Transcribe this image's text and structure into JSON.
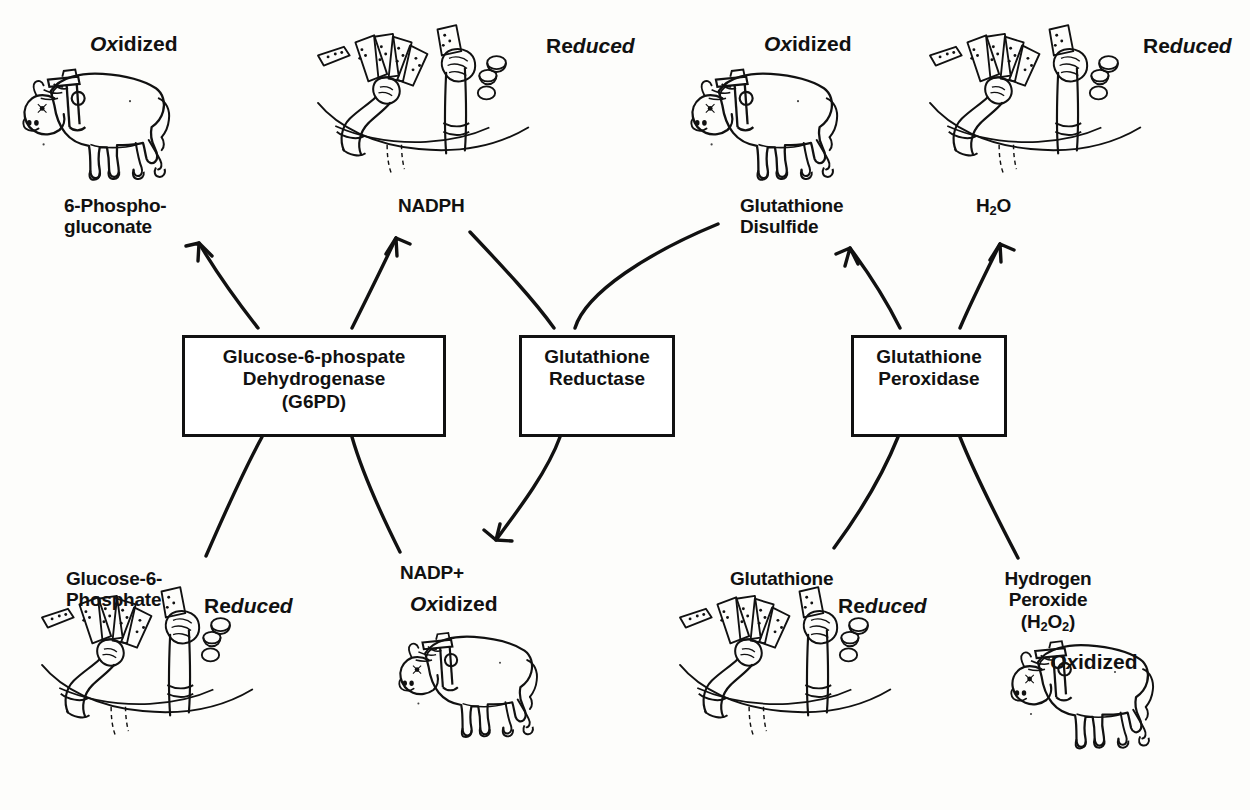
{
  "diagram": {
    "type": "biochemical-pathway-mnemonic",
    "background_color": "#fdfdfb",
    "ink_color": "#111111"
  },
  "enzymes": [
    {
      "id": "g6pd",
      "label": "Glucose-6-phospate\nDehydrogenase\n(G6PD)"
    },
    {
      "id": "glutathione-reductase",
      "label": "Glutathione\nReductase"
    },
    {
      "id": "glutathione-peroxidase",
      "label": "Glutathione\nPeroxidase"
    }
  ],
  "metabolites": {
    "top": [
      {
        "id": "6-phosphogluconate",
        "label": "6-Phospho-\ngluconate"
      },
      {
        "id": "nadph",
        "label": "NADPH"
      },
      {
        "id": "glutathione-disulfide",
        "label": "Glutathione\nDisulfide"
      },
      {
        "id": "water",
        "label": "H2O",
        "html": "H<sub>2</sub>O"
      }
    ],
    "bottom": [
      {
        "id": "glucose-6-phosphate",
        "label": "Glucose-6-\nPhosphate"
      },
      {
        "id": "nadp-plus",
        "label": "NADP+"
      },
      {
        "id": "glutathione",
        "label": "Glutathione"
      },
      {
        "id": "hydrogen-peroxide",
        "label": "Hydrogen\nPeroxide\n(H2O2)",
        "html": "Hydrogen<br>Peroxide<br>(H<sub>2</sub>O<sub>2</sub>)"
      }
    ]
  },
  "states": {
    "oxidized": {
      "prefix": "Ox",
      "suffix": "idized",
      "mnemonic": "ox-cartoon"
    },
    "reduced": {
      "prefix": "Re",
      "suffix": "duced",
      "mnemonic": "gambler-cartoon"
    }
  },
  "state_labels": [
    {
      "id": "state-top-left",
      "kind": "oxidized"
    },
    {
      "id": "state-top-nadph",
      "kind": "reduced"
    },
    {
      "id": "state-top-gssg",
      "kind": "oxidized"
    },
    {
      "id": "state-top-water",
      "kind": "reduced"
    },
    {
      "id": "state-bottom-g6p",
      "kind": "reduced"
    },
    {
      "id": "state-bottom-nadp",
      "kind": "oxidized"
    },
    {
      "id": "state-bottom-gsh",
      "kind": "reduced"
    },
    {
      "id": "state-bottom-h2o2",
      "kind": "oxidized"
    }
  ],
  "arrows": [
    {
      "id": "g6pd-to-6-phosphogluconate",
      "from": "g6pd",
      "to": "6-phosphogluconate",
      "direction": "up"
    },
    {
      "id": "g6pd-to-nadph",
      "from": "g6pd",
      "to": "nadph",
      "direction": "up"
    },
    {
      "id": "glucose-6-phosphate-to-g6pd",
      "from": "glucose-6-phosphate",
      "to": "g6pd",
      "direction": "in"
    },
    {
      "id": "g6pd-to-nadp-plus",
      "from": "g6pd",
      "to": "nadp-plus",
      "direction": "down"
    },
    {
      "id": "nadph-to-glutathione-reductase",
      "from": "nadph",
      "to": "glutathione-reductase",
      "direction": "in"
    },
    {
      "id": "glutathione-reductase-to-gssg",
      "from": "glutathione-reductase",
      "to": "glutathione-disulfide",
      "direction": "up"
    },
    {
      "id": "glutathione-reductase-to-glutathione",
      "from": "glutathione-reductase",
      "to": "glutathione",
      "direction": "down"
    },
    {
      "id": "glutathione-peroxidase-to-gssg",
      "from": "glutathione-peroxidase",
      "to": "glutathione-disulfide",
      "direction": "up"
    },
    {
      "id": "glutathione-peroxidase-to-water",
      "from": "glutathione-peroxidase",
      "to": "water",
      "direction": "up"
    },
    {
      "id": "glutathione-to-peroxidase",
      "from": "glutathione",
      "to": "glutathione-peroxidase",
      "direction": "in"
    },
    {
      "id": "h2o2-to-peroxidase",
      "from": "hydrogen-peroxide",
      "to": "glutathione-peroxidase",
      "direction": "in"
    }
  ],
  "illustrations": [
    {
      "id": "ox-top-left",
      "kind": "ox",
      "meaning": "Oxidized mnemonic: an ox with a yoke"
    },
    {
      "id": "gambler-top-mid",
      "kind": "gambler",
      "meaning": "Reduced mnemonic: gambler's hands with cards and chips"
    },
    {
      "id": "ox-top-right",
      "kind": "ox",
      "meaning": "Oxidized mnemonic: an ox with a yoke"
    },
    {
      "id": "gambler-top-far",
      "kind": "gambler",
      "meaning": "Reduced mnemonic: gambler's hands with cards and chips"
    },
    {
      "id": "gambler-bot-left",
      "kind": "gambler",
      "meaning": "Reduced mnemonic: gambler's hands with cards and chips"
    },
    {
      "id": "ox-bot-mid",
      "kind": "ox",
      "meaning": "Oxidized mnemonic: an ox with a yoke"
    },
    {
      "id": "gambler-bot-mid",
      "kind": "gambler",
      "meaning": "Reduced mnemonic: gambler's hands with cards and chips"
    },
    {
      "id": "ox-bot-right",
      "kind": "ox",
      "meaning": "Oxidized mnemonic: an ox with a yoke"
    }
  ]
}
